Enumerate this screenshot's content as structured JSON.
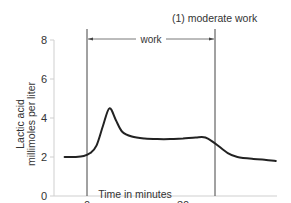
{
  "chart_data": {
    "type": "line",
    "title": "(1) moderate work",
    "xlabel": "Time in minutes",
    "ylabel_line1": "Lactic acid",
    "ylabel_line2": "millimoles per liter",
    "x_ticks": [
      0,
      30
    ],
    "x_tick_labels": [
      "0",
      "30"
    ],
    "y_ticks": [
      0,
      2,
      4,
      6,
      8
    ],
    "y_tick_labels": [
      "0",
      "2",
      "4",
      "6",
      "8"
    ],
    "ylim": [
      0,
      8
    ],
    "xlim": [
      -10,
      60
    ],
    "grid": false,
    "annotations": [
      {
        "text": "work",
        "type": "span",
        "x_start": 0,
        "x_end": 40
      }
    ],
    "series": [
      {
        "name": "Lactic acid (moderate work)",
        "x": [
          -7,
          -4,
          -1,
          1,
          3,
          5,
          7,
          9,
          11,
          14,
          18,
          22,
          26,
          30,
          34,
          37,
          40,
          44,
          47,
          52,
          56,
          59
        ],
        "values": [
          2.0,
          2.0,
          2.05,
          2.2,
          2.6,
          3.6,
          4.5,
          3.9,
          3.3,
          3.05,
          2.95,
          2.92,
          2.92,
          2.95,
          3.0,
          3.0,
          2.7,
          2.2,
          2.0,
          1.9,
          1.85,
          1.8
        ]
      }
    ]
  }
}
